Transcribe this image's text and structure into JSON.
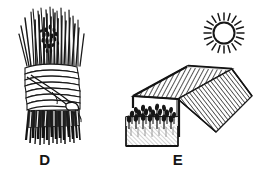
{
  "plate": {
    "background_color": "#ffffff",
    "ink_color": "#161616",
    "style": "black-and-white pen-and-ink line drawing",
    "width": 268,
    "height": 183
  },
  "figures": [
    {
      "id": "D",
      "label": "D",
      "name": "straw-bundle",
      "caption_text": "D",
      "description": "Bundle of long straw or thatch stalks gathered upright and bound near the middle with a coiled rope tie finished in a knot; the cut ends fan out darkly at the base.",
      "parts": [
        {
          "name": "straw-tops",
          "label": "straw tops"
        },
        {
          "name": "seed-heads",
          "label": "seed heads"
        },
        {
          "name": "rope-binding",
          "label": "rope binding"
        },
        {
          "name": "rope-knot",
          "label": "rope knot"
        },
        {
          "name": "straw-butt-ends",
          "label": "cut butt ends"
        }
      ]
    },
    {
      "id": "E",
      "label": "E",
      "name": "shaded-seedbed",
      "caption_text": "E",
      "description": "Raised nursery seedbed planted with rows of young seedlings, sheltered beneath a flat slatted shade roof supported on posts, with the sun shining above at the upper right.",
      "parts": [
        {
          "name": "sun",
          "label": "sun"
        },
        {
          "name": "shade-roof",
          "label": "slatted shade roof"
        },
        {
          "name": "roof-side-panel",
          "label": "roof side panel"
        },
        {
          "name": "support-post",
          "label": "support post"
        },
        {
          "name": "seedbed-frame",
          "label": "raised seedbed frame"
        },
        {
          "name": "seedlings",
          "label": "rows of seedlings"
        }
      ]
    }
  ],
  "labels": {
    "d": "D",
    "e": "E"
  },
  "colors": {
    "ink": "#161616",
    "paper": "#ffffff",
    "mid_gray": "#8a8a8a",
    "light_gray": "#c9c9c9"
  }
}
